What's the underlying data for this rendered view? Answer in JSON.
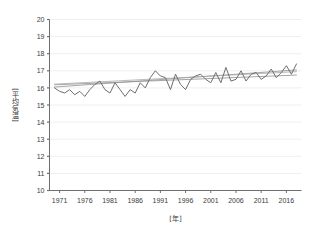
{
  "chart_data": {
    "type": "line",
    "title": "",
    "xlabel": "[年]",
    "ylabel": "[平均気温]",
    "xlim": [
      1969,
      2019
    ],
    "ylim": [
      10,
      20
    ],
    "grid": true,
    "legend": "none",
    "xticks": [
      1971,
      1976,
      1981,
      1986,
      1991,
      1996,
      2001,
      2006,
      2011,
      2016
    ],
    "yticks": [
      10,
      11,
      12,
      13,
      14,
      15,
      16,
      17,
      18,
      19,
      20
    ],
    "series": [
      {
        "name": "年平均気温",
        "color": "#6e6e6e",
        "x": [
          1970,
          1971,
          1972,
          1973,
          1974,
          1975,
          1976,
          1977,
          1978,
          1979,
          1980,
          1981,
          1982,
          1983,
          1984,
          1985,
          1986,
          1987,
          1988,
          1989,
          1990,
          1991,
          1992,
          1993,
          1994,
          1995,
          1996,
          1997,
          1998,
          1999,
          2000,
          2001,
          2002,
          2003,
          2004,
          2005,
          2006,
          2007,
          2008,
          2009,
          2010,
          2011,
          2012,
          2013,
          2014,
          2015,
          2016,
          2017,
          2018
        ],
        "values": [
          16.0,
          15.8,
          15.7,
          15.9,
          15.6,
          15.8,
          15.5,
          15.9,
          16.2,
          16.4,
          15.9,
          15.7,
          16.3,
          15.9,
          15.5,
          15.9,
          15.7,
          16.3,
          16.0,
          16.6,
          17.0,
          16.7,
          16.6,
          15.9,
          16.8,
          16.2,
          15.9,
          16.5,
          16.7,
          16.8,
          16.5,
          16.3,
          16.9,
          16.3,
          17.2,
          16.4,
          16.5,
          17.0,
          16.4,
          16.8,
          16.9,
          16.5,
          16.7,
          17.1,
          16.6,
          16.9,
          17.3,
          16.8,
          17.4
        ]
      },
      {
        "name": "回帰直線1",
        "color": "#8f8f8f",
        "x": [
          1970,
          2018
        ],
        "values": [
          16.05,
          17.05
        ]
      },
      {
        "name": "回帰直線2",
        "color": "#8f8f8f",
        "x": [
          1970,
          2018
        ],
        "values": [
          16.18,
          16.75
        ]
      },
      {
        "name": "回帰直線3",
        "color": "#a8a8a8",
        "x": [
          1970,
          2018
        ],
        "values": [
          16.22,
          16.95
        ]
      }
    ]
  },
  "colors": {
    "axis": "#6e6e6e",
    "grid": "#efefef",
    "text": "#3b3b3b",
    "background": "#ffffff"
  }
}
